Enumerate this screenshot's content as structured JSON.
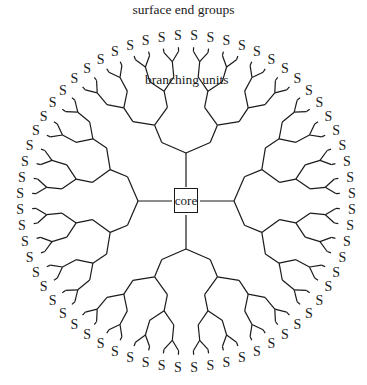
{
  "labels": {
    "title": "surface end groups",
    "branching": "branching units",
    "core": "core",
    "end_group": "S"
  },
  "geometry": {
    "center": [
      186,
      201
    ],
    "terminal_radius": 166,
    "generations": 4,
    "primary_branches": 4,
    "end_groups_count": 64,
    "line_color": "#1a1a1a"
  }
}
